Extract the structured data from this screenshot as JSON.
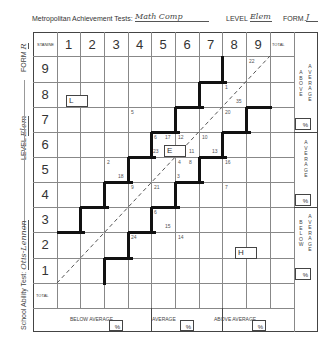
{
  "header": {
    "test_label": "Metropolitan Achievement Tests:",
    "test_value": "Math Comp",
    "level_label": "LEVEL",
    "level_value": "Elem",
    "form_label": "FORM",
    "form_value": "J"
  },
  "side_labels": {
    "form": "FORM",
    "form_value": "R",
    "level": "LEVEL",
    "level_value": "Elem",
    "school_ability": "School Ability Test:",
    "school_ability_value": "Otis-Lennon"
  },
  "grid": {
    "corner_label": "STANINE",
    "total_label": "TOTAL",
    "columns": [
      "1",
      "2",
      "3",
      "4",
      "5",
      "6",
      "7",
      "8",
      "9"
    ],
    "rows": [
      "9",
      "8",
      "7",
      "6",
      "5",
      "4",
      "3",
      "2",
      "1"
    ],
    "row_total_label": "TOTAL"
  },
  "cell_annotations": [
    {
      "text": "22",
      "col": 9,
      "row": 9,
      "pos": "tl"
    },
    {
      "text": "1",
      "col": 8,
      "row": 8,
      "pos": "tl"
    },
    {
      "text": "35",
      "col": 8,
      "row": 8,
      "pos": "br"
    },
    {
      "text": "5",
      "col": 4,
      "row": 7,
      "pos": "tl"
    },
    {
      "text": "20",
      "col": 8,
      "row": 7,
      "pos": "tl"
    },
    {
      "text": "6",
      "col": 5,
      "row": 6,
      "pos": "tl"
    },
    {
      "text": "17",
      "col": 5,
      "row": 6,
      "pos": "tr"
    },
    {
      "text": "12",
      "col": 6,
      "row": 6,
      "pos": "tl"
    },
    {
      "text": "10",
      "col": 7,
      "row": 6,
      "pos": "tl"
    },
    {
      "text": "23",
      "col": 5,
      "row": 6,
      "pos": "bl"
    },
    {
      "text": "11",
      "col": 6,
      "row": 6,
      "pos": "br"
    },
    {
      "text": "13",
      "col": 7,
      "row": 6,
      "pos": "br"
    },
    {
      "text": "2",
      "col": 3,
      "row": 5,
      "pos": "tl"
    },
    {
      "text": "18",
      "col": 3,
      "row": 5,
      "pos": "br"
    },
    {
      "text": "4",
      "col": 6,
      "row": 5,
      "pos": "tl"
    },
    {
      "text": "8",
      "col": 6,
      "row": 5,
      "pos": "tr"
    },
    {
      "text": "16",
      "col": 8,
      "row": 5,
      "pos": "tl"
    },
    {
      "text": "3",
      "col": 6,
      "row": 5,
      "pos": "bl"
    },
    {
      "text": "9",
      "col": 4,
      "row": 4,
      "pos": "tl"
    },
    {
      "text": "21",
      "col": 5,
      "row": 4,
      "pos": "tl"
    },
    {
      "text": "7",
      "col": 8,
      "row": 4,
      "pos": "tl"
    },
    {
      "text": "6",
      "col": 5,
      "row": 3,
      "pos": "tl"
    },
    {
      "text": "15",
      "col": 5,
      "row": 3,
      "pos": "br"
    },
    {
      "text": "24",
      "col": 4,
      "row": 2,
      "pos": "tl"
    },
    {
      "text": "14",
      "col": 6,
      "row": 2,
      "pos": "tl"
    }
  ],
  "student_boxes": [
    {
      "label": "L"
    },
    {
      "label": "E"
    },
    {
      "label": "H"
    }
  ],
  "right_bands": {
    "above": {
      "left": "ABOVE",
      "right": "AVERAGE",
      "pct": "%"
    },
    "average": {
      "text": "AVERAGE",
      "pct": "%"
    },
    "below": {
      "left": "BELOW",
      "right": "AVERAGE",
      "pct": "%"
    }
  },
  "bottom_bands": {
    "below": {
      "label": "BELOW AVERAGE",
      "pct": "%"
    },
    "average": {
      "label": "AVERAGE",
      "pct": "%"
    },
    "above": {
      "label": "ABOVE AVERAGE",
      "pct": "%"
    }
  }
}
